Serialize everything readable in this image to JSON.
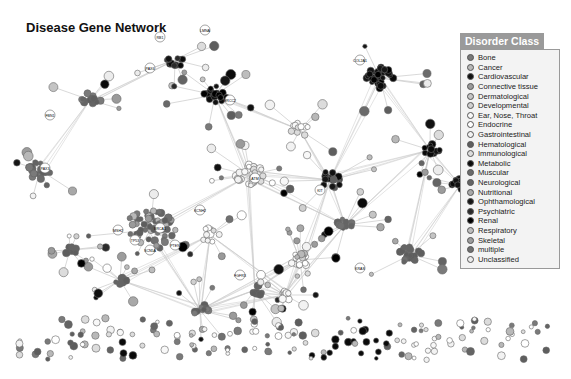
{
  "title": "Disease Gene Network",
  "legend": {
    "title": "Disorder Class",
    "items": [
      {
        "label": "Bone",
        "color": "#7a7a7a"
      },
      {
        "label": "Cancer",
        "color": "#b8b8b8"
      },
      {
        "label": "Cardiovascular",
        "color": "#111111"
      },
      {
        "label": "Connective tissue",
        "color": "#9a9a9a"
      },
      {
        "label": "Dermatological",
        "color": "#c4c4c4"
      },
      {
        "label": "Developmental",
        "color": "#d0d0d0"
      },
      {
        "label": "Ear, Nose, Throat",
        "color": "#f8f8f8"
      },
      {
        "label": "Endocrine",
        "color": "#ffffff"
      },
      {
        "label": "Gastrointestinal",
        "color": "#f2f2f2"
      },
      {
        "label": "Hematological",
        "color": "#5e5e5e"
      },
      {
        "label": "Immunological",
        "color": "#dcdcdc"
      },
      {
        "label": "Metabolic",
        "color": "#0a0a0a"
      },
      {
        "label": "Muscular",
        "color": "#6a6a6a"
      },
      {
        "label": "Neurological",
        "color": "#646464"
      },
      {
        "label": "Nutritional",
        "color": "#a8a8a8"
      },
      {
        "label": "Ophthamological",
        "color": "#161616"
      },
      {
        "label": "Psychiatric",
        "color": "#2a2a2a"
      },
      {
        "label": "Renal",
        "color": "#000000"
      },
      {
        "label": "Respiratory",
        "color": "#bdbdbd"
      },
      {
        "label": "Skeletal",
        "color": "#9c9c9c"
      },
      {
        "label": "multiple",
        "color": "#707070"
      },
      {
        "label": "Unclassified",
        "color": "#ececec"
      }
    ]
  },
  "node_labels": [
    "RB1",
    "PAX6",
    "LMNA",
    "COL2A1",
    "FBN1",
    "KIT",
    "BRCA1",
    "TP53",
    "PTEN",
    "KRAS",
    "ATM",
    "MSH2",
    "FGFR3",
    "SCN5A",
    "KCNH2",
    "PAX3",
    "ERCC2"
  ]
}
